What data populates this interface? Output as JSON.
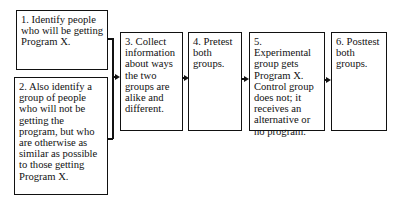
{
  "diagram": {
    "type": "flowchart",
    "steps": [
      {
        "id": 1,
        "text": "1. Identify people who will be getting Program X."
      },
      {
        "id": 2,
        "text": "2. Also identify a group of people who will not be getting the program, but who are otherwise as similar as possible to those getting Program X."
      },
      {
        "id": 3,
        "text": "3. Collect information about ways the two groups are alike and different."
      },
      {
        "id": 4,
        "text": "4. Pretest both groups."
      },
      {
        "id": 5,
        "text": "5. Experimental group gets Program X. Control group does not; it receives an alternative or no program."
      },
      {
        "id": 6,
        "text": "6. Posttest both groups."
      }
    ],
    "edges": [
      {
        "from": [
          1,
          2
        ],
        "to": 3,
        "style": "bracket-arrow"
      },
      {
        "from": 3,
        "to": 4,
        "style": "arrow"
      },
      {
        "from": 4,
        "to": 5,
        "style": "arrow"
      },
      {
        "from": 5,
        "to": 6,
        "style": "arrow"
      }
    ]
  }
}
